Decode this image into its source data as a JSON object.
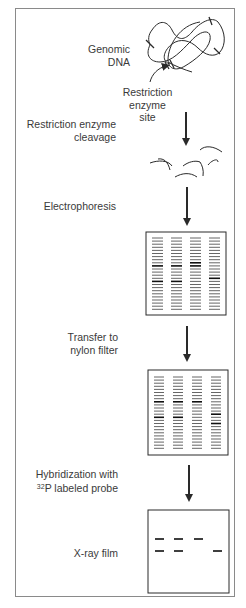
{
  "steps": {
    "genomic_dna": {
      "line1": "Genomic",
      "line2": "DNA"
    },
    "site": {
      "line1": "Restriction",
      "line2": "enzyme",
      "line3": "site"
    },
    "cleavage": {
      "line1": "Restriction enzyme",
      "line2": "cleavage"
    },
    "electrophoresis": {
      "label": "Electrophoresis"
    },
    "transfer": {
      "line1": "Transfer to",
      "line2": "nylon filter"
    },
    "hybridization": {
      "line1": "Hybridization with",
      "isotope_sup": "32",
      "line2_rest": "P labeled probe"
    },
    "xray": {
      "label": "X-ray film"
    }
  },
  "gel": {
    "lanes": 4,
    "bands_per_lane": 24,
    "dark_bands": [
      [
        9,
        14
      ],
      [
        9,
        14
      ],
      [
        8,
        9
      ],
      [
        13
      ]
    ]
  },
  "filter": {
    "lanes": 4,
    "bands_per_lane": 24,
    "dark_bands": [
      [
        8,
        13
      ],
      [
        8,
        13
      ],
      [
        8
      ],
      [
        12,
        15
      ]
    ]
  },
  "xray_film": {
    "bands_row1_lanes": [
      1,
      2,
      3
    ],
    "bands_row2_lanes": [
      1,
      2,
      4
    ]
  },
  "colors": {
    "line": "#2a2a2a",
    "frame": "#8a8a8a",
    "text": "#3a3a3a"
  }
}
